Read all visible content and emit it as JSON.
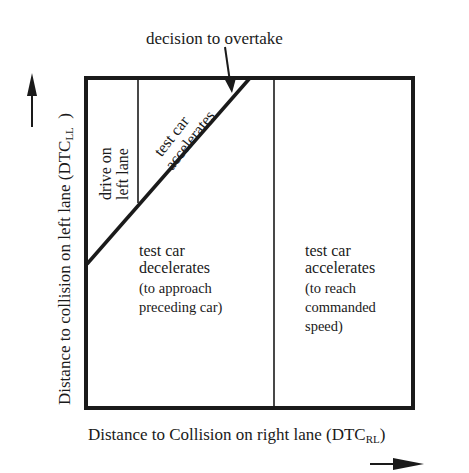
{
  "annotation": {
    "text": "decision to overtake"
  },
  "axes": {
    "y_label": "Distance to collision on left lane (DTC",
    "y_label_sub": "LL",
    "y_label_end": ")",
    "x_label": "Distance to Collision on right lane (DTC",
    "x_label_sub": "RL",
    "x_label_end": ")"
  },
  "regions": {
    "drive_left": {
      "line1": "drive on",
      "line2": "left lane"
    },
    "accel_top": {
      "line1": "test car",
      "line2": "accelerates"
    },
    "decel": {
      "line1": "test car",
      "line2": "decelerates",
      "line3": "(to approach",
      "line4": "preceding car)"
    },
    "accel_right": {
      "line1": "test car",
      "line2": "accelerates",
      "line3": "(to reach",
      "line4": "commanded",
      "line5": "speed)"
    }
  },
  "colors": {
    "ink": "#1a1a1a",
    "background": "#ffffff"
  }
}
